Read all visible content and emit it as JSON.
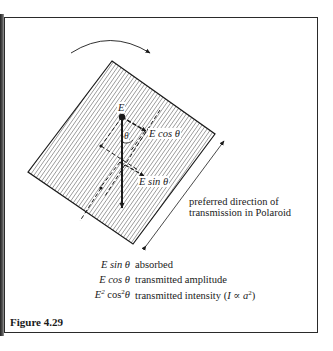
{
  "figure": {
    "caption": "Figure 4.29",
    "rotation_arrow": "clockwise-rotation-arrow",
    "vector_labels": {
      "E": "E",
      "theta": "θ",
      "E_cos": "E cos θ",
      "E_sin": "E sin θ"
    },
    "direction_label": {
      "line1": "preferred direction of",
      "line2": "transmission in Polaroid"
    },
    "legend": [
      {
        "expr": "E sin θ",
        "desc": "absorbed"
      },
      {
        "expr": "E cos θ",
        "desc": "transmitted amplitude"
      },
      {
        "expr_base": "E",
        "expr_sup1": "2",
        "expr_mid": " cos",
        "expr_sup2": "2",
        "expr_end": "θ",
        "desc_text": "transmitted intensity (",
        "desc_math": "I ∝ a",
        "desc_sup": "2",
        "desc_close": ")"
      }
    ],
    "colors": {
      "ink": "#1a1a1a",
      "hatch": "#6b6b6b",
      "background": "#ffffff"
    }
  }
}
